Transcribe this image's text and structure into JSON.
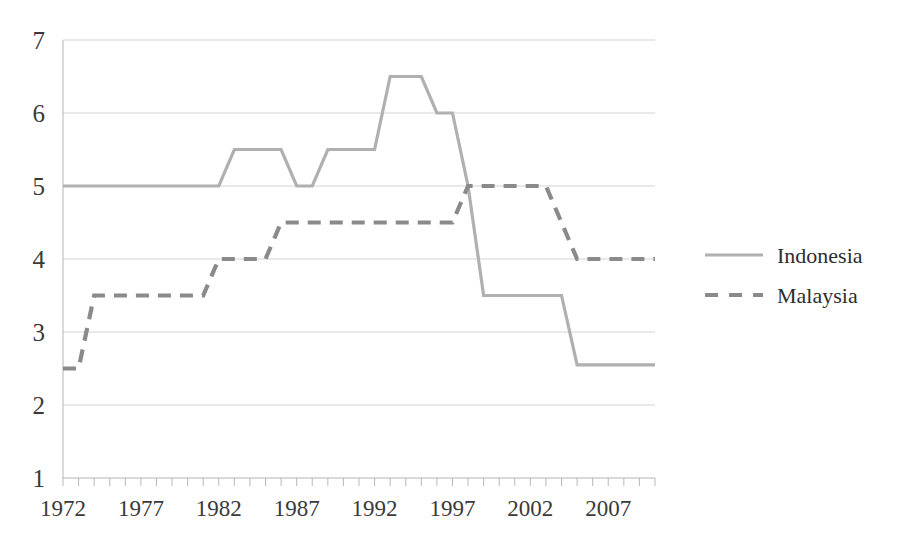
{
  "chart_data": {
    "type": "line",
    "title": "",
    "subtitle": "",
    "xlabel": "",
    "ylabel": "",
    "xlim": [
      1972,
      2010
    ],
    "ylim": [
      1,
      7
    ],
    "ytick_values": [
      1,
      2,
      3,
      4,
      5,
      6,
      7
    ],
    "ytick_labels": [
      "1",
      "2",
      "3",
      "4",
      "5",
      "6",
      "7"
    ],
    "xtick_labels": [
      "1972",
      "1977",
      "1982",
      "1987",
      "1992",
      "1997",
      "2002",
      "2007"
    ],
    "xtick_values": [
      1972,
      1977,
      1982,
      1987,
      1992,
      1997,
      2002,
      2007
    ],
    "minor_xticks_every": 1,
    "grid": "horizontal",
    "legend_position": "right",
    "x": [
      1972,
      1973,
      1974,
      1975,
      1976,
      1977,
      1978,
      1979,
      1980,
      1981,
      1982,
      1983,
      1984,
      1985,
      1986,
      1987,
      1988,
      1989,
      1990,
      1991,
      1992,
      1993,
      1994,
      1995,
      1996,
      1997,
      1998,
      1999,
      2000,
      2001,
      2002,
      2003,
      2004,
      2005,
      2006,
      2007,
      2008,
      2009,
      2010
    ],
    "series": [
      {
        "name": "Indonesia",
        "style": "solid",
        "color": "#b0b0b0",
        "values": [
          5,
          5,
          5,
          5,
          5,
          5,
          5,
          5,
          5,
          5,
          5,
          5.5,
          5.5,
          5.5,
          5.5,
          5,
          5,
          5.5,
          5.5,
          5.5,
          5.5,
          6.5,
          6.5,
          6.5,
          6,
          6,
          5,
          3.5,
          3.5,
          3.5,
          3.5,
          3.5,
          3.5,
          2.55,
          2.55,
          2.55,
          2.55,
          2.55,
          2.55
        ]
      },
      {
        "name": "Malaysia",
        "style": "dashed",
        "color": "#8a8a8a",
        "values": [
          2.5,
          2.5,
          3.5,
          3.5,
          3.5,
          3.5,
          3.5,
          3.5,
          3.5,
          3.5,
          4,
          4,
          4,
          4,
          4.5,
          4.5,
          4.5,
          4.5,
          4.5,
          4.5,
          4.5,
          4.5,
          4.5,
          4.5,
          4.5,
          4.5,
          5,
          5,
          5,
          5,
          5,
          5,
          4.5,
          4,
          4,
          4,
          4,
          4,
          4
        ]
      }
    ],
    "legend": [
      {
        "label": "Indonesia",
        "style": "solid",
        "color": "#b0b0b0"
      },
      {
        "label": "Malaysia",
        "style": "dashed",
        "color": "#8a8a8a"
      }
    ],
    "axis_color": "#b4b4b4",
    "grid_color": "#c8c8c8"
  }
}
